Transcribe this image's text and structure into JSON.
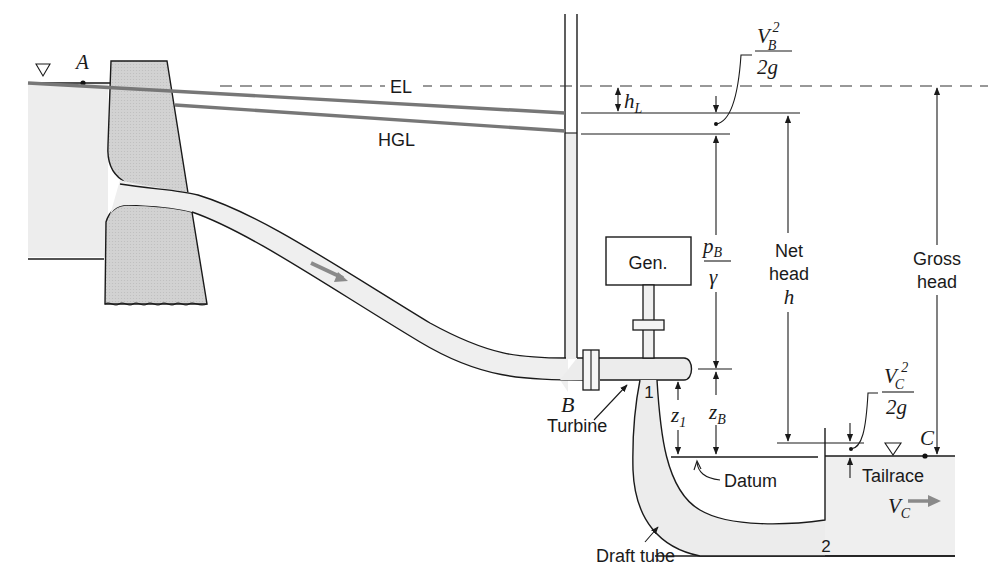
{
  "figure": {
    "colors": {
      "water_fill": "#ebebeb",
      "dam_fill": "#cfcfcf",
      "pipe_fill": "#ececec",
      "line": "#1a1a1a",
      "grade_lines": "#777777",
      "flow_arrow": "#808080",
      "background": "#ffffff"
    }
  },
  "points": {
    "A": "A",
    "B": "B",
    "C": "C",
    "section_1": "1",
    "section_2": "2"
  },
  "lines": {
    "energy_line": "EL",
    "hydraulic_grade_line": "HGL"
  },
  "labels": {
    "head_loss": {
      "main": "h",
      "sub": "L"
    },
    "velocity_head_B": {
      "num_main": "V",
      "num_sub": "B",
      "num_sup": "2",
      "den": "2g"
    },
    "pressure_head_B": {
      "num_main": "p",
      "num_sub": "B",
      "den": "γ"
    },
    "elevation_B": {
      "main": "z",
      "sub": "B"
    },
    "elevation_1": {
      "main": "z",
      "sub": "1"
    },
    "net_head": {
      "line1": "Net",
      "line2": "head",
      "symbol": "h"
    },
    "gross_head": {
      "line1": "Gross",
      "line2": "head"
    },
    "velocity_head_C": {
      "num_main": "V",
      "num_sub": "C",
      "num_sup": "2",
      "den": "2g"
    },
    "velocity_C": {
      "main": "V",
      "sub": "C"
    },
    "generator": "Gen.",
    "turbine": "Turbine",
    "draft_tube": "Draft tube",
    "datum": "Datum",
    "tailrace": "Tailrace"
  },
  "symbols": {
    "free_surface_upstream": "▽",
    "free_surface_tailrace": "▽"
  }
}
